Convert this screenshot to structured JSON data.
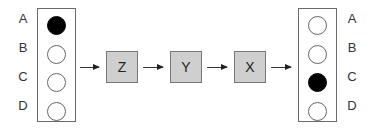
{
  "input_column": {
    "items": [
      {
        "label": "A",
        "state": "filled"
      },
      {
        "label": "B",
        "state": "empty"
      },
      {
        "label": "C",
        "state": "empty"
      },
      {
        "label": "D",
        "state": "empty"
      }
    ]
  },
  "stages": [
    {
      "label": "Z"
    },
    {
      "label": "Y"
    },
    {
      "label": "X"
    }
  ],
  "output_column": {
    "items": [
      {
        "label": "A",
        "state": "empty"
      },
      {
        "label": "B",
        "state": "empty"
      },
      {
        "label": "C",
        "state": "filled"
      },
      {
        "label": "D",
        "state": "empty"
      }
    ]
  },
  "colors": {
    "stage_fill": "#cfcfcf",
    "dot_filled": "#000000",
    "border": "#6a6a6a"
  }
}
